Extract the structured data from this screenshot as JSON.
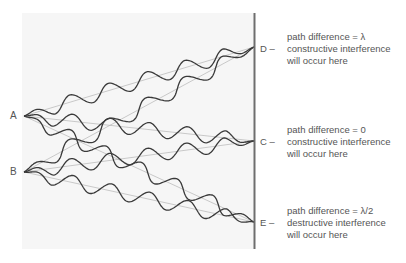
{
  "diagram": {
    "sources": [
      {
        "id": "A",
        "label": "A",
        "x": 24,
        "y": 116
      },
      {
        "id": "B",
        "label": "B",
        "x": 24,
        "y": 172
      }
    ],
    "points": [
      {
        "id": "D",
        "label": "D",
        "x": 254,
        "y": 47
      },
      {
        "id": "C",
        "label": "C",
        "x": 254,
        "y": 141
      },
      {
        "id": "E",
        "label": "E",
        "x": 254,
        "y": 222
      }
    ],
    "annotations": [
      {
        "point": "D",
        "prefix": "D –",
        "line1": "path difference = λ",
        "line2": "constructive interference",
        "line3": "will occur here"
      },
      {
        "point": "C",
        "prefix": "C –",
        "line1": "path difference = 0",
        "line2": "constructive interference",
        "line3": "will occur here"
      },
      {
        "point": "E",
        "prefix": "E –",
        "line1": "path difference = λ/2",
        "line2": "destructive interference",
        "line3": "will occur here"
      }
    ],
    "colors": {
      "background_panel": "#f6f6f6",
      "wave": "#3a3a3a",
      "ray": "#b5b5b5",
      "screen": "#6e6e6e",
      "text": "#555555"
    }
  }
}
